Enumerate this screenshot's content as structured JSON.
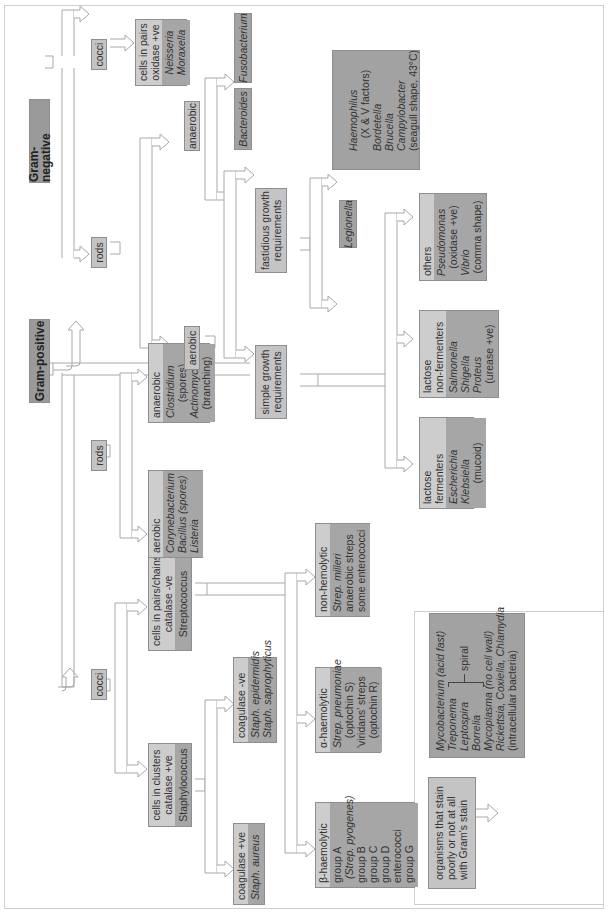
{
  "diagram": {
    "orientation": "rotated 90 degrees counter-clockwise",
    "colors": {
      "title_box": "#9a9a9a",
      "light_box": "#c8c8c8",
      "dark_box": "#a2a2a2",
      "arrow_stroke": "#a8a8a8"
    },
    "gram_positive": {
      "title": "Gram-positive",
      "cocci": {
        "label": "cocci",
        "clusters": {
          "lines": [
            "cells in clusters",
            "catalase +ve"
          ],
          "genus": "Staphylococcus",
          "coag_pos": {
            "header": "coagulase +ve",
            "organisms": [
              "Staph. aureus"
            ]
          },
          "coag_neg": {
            "header": "coagulase -ve",
            "organisms": [
              "Staph. epidermidis",
              "Staph. saprophyticus"
            ]
          }
        },
        "chains": {
          "lines": [
            "cells in pairs/chains",
            "catalase -ve"
          ],
          "genus": "Streptococcus",
          "beta": {
            "header": "β-haemolytic",
            "items": [
              "group A",
              "(Strep. pyogenes)",
              "group B",
              "group C",
              "group D",
              "enterococci",
              "group G"
            ]
          },
          "alpha": {
            "header": "α-haemolytic",
            "items": [
              "Strep. pneumoniae",
              "(optochin S)",
              "'viridans' streps",
              "(optochin R)"
            ]
          },
          "non": {
            "header": "non-hemolytic",
            "items": [
              "Strep. milleri",
              "anaerobic streps",
              "some enterococci"
            ]
          }
        }
      },
      "rods": {
        "label": "rods",
        "aerobic": {
          "header": "aerobic",
          "items": [
            "Corynebacterium",
            "Bacillus (spores)",
            "Listeria"
          ]
        },
        "anaerobic": {
          "header": "anaerobic",
          "items": [
            "Clostridium",
            "(spores)",
            "Actinomyces",
            "(branching)"
          ]
        }
      }
    },
    "gram_negative": {
      "title": "Gram-negative",
      "cocci": {
        "label": "cocci",
        "pairs": {
          "lines": [
            "cells in pairs",
            "oxidase +ve"
          ],
          "organisms": [
            "Neisseria",
            "Moraxella"
          ]
        }
      },
      "rods": {
        "label": "rods",
        "anaerobic": {
          "label": "anaerobic",
          "organisms": [
            "Bacteroides",
            "Fusobacterium"
          ]
        },
        "aerobic": {
          "label": "aerobic",
          "fastidious": {
            "lines": [
              "fastidious growth",
              "requirements"
            ],
            "legionella": "Legionella",
            "others": [
              "Haemophilus",
              "(X & V factors)",
              "Bordetella",
              "Brucella",
              "Campylobacter",
              "(seagull shape, 43°C)"
            ]
          },
          "simple": {
            "lines": [
              "simple growth",
              "requirements"
            ],
            "lactose_fermenters": {
              "header": "lactose fermenters",
              "items": [
                "Escherichia",
                "Klebsiella",
                "(mucoid)"
              ]
            },
            "lactose_non_fermenters": {
              "header": [
                "lactose",
                "non-fermenters"
              ],
              "items": [
                "Salmonella",
                "Shigella",
                "Proteus",
                "(urease +ve)"
              ]
            },
            "others": {
              "header": "others",
              "items": [
                "Pseudomonas",
                "(oxidase +ve)",
                "Vibrio",
                "(comma shape)"
              ]
            }
          }
        }
      }
    },
    "poor_stain": {
      "lines": [
        "organisms that stain",
        "poorly or not at all",
        "with Gram's stain"
      ],
      "items": {
        "mycobacterium": "Mycobacterium (acid fast)",
        "treponema": "Treponema",
        "leptospira": "Leptospira",
        "borrelia": "Borrelia",
        "spiral_label": "spiral",
        "mycoplasma": "Mycoplasma (no cell wall)",
        "rickettsia": "Rickettsia, Coxiella, Chlamydia",
        "intracellular": "(intracellular bacteria)"
      }
    }
  }
}
